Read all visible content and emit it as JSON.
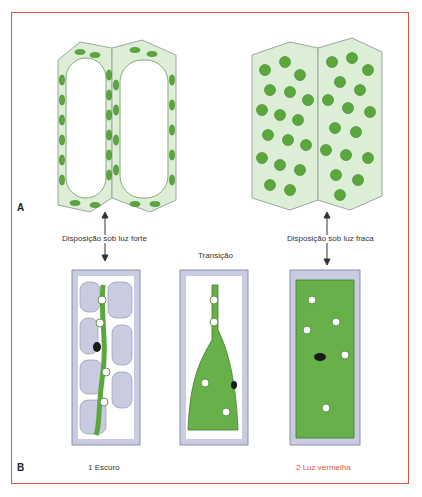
{
  "figure": {
    "frame_color": "#d9574a",
    "panel_a": {
      "letter": "A",
      "label_left": "Disposição sob luz forte",
      "label_right": "Disposição sob luz fraca"
    },
    "panel_b": {
      "letter": "B",
      "label_middle_top": "Transição",
      "label_left": "1 Escuro",
      "label_right": "2 Luz vermelha",
      "label_right_color": "#d9574a"
    },
    "colors": {
      "chloroplast": "#5aa83c",
      "chloroplast_dark": "#3f7f2a",
      "cell_fill": "#dff0d8",
      "cell_outline": "#9aa6a0",
      "vacuole_gray": "#c9cbe0",
      "cytoplasm_green": "#68b04a"
    }
  }
}
